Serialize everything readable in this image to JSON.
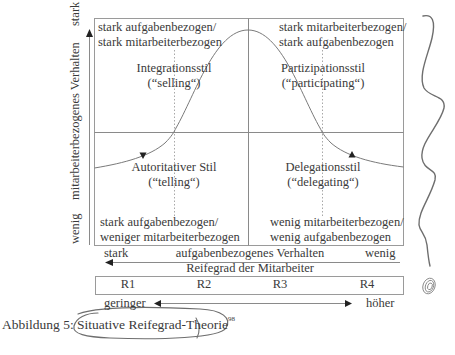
{
  "quadrants": {
    "top_left": {
      "line1": "stark aufgabenbezogen/",
      "line2": "stark mitarbeiterbezogen",
      "style": "Integrationsstil",
      "style_en": "(“selling“)"
    },
    "top_right": {
      "line1": "stark mitarbeiterbezogen/",
      "line2": "stark aufgabenbezogen",
      "style": "Partizipationsstil",
      "style_en": "(“participating“)"
    },
    "bottom_left": {
      "style": "Autoritativer Stil",
      "style_en": "(“telling“)",
      "line1": "stark aufgabenbezogen/",
      "line2": "weniger mitarbeiterbezogen"
    },
    "bottom_right": {
      "style": "Delegationsstil",
      "style_en": "(“delegating“)",
      "line1": "wenig mitarbeiterbezogen/",
      "line2": "wenig aufgabenbezogen"
    }
  },
  "y_axis": {
    "label": "mitarbeiterbezogenes Verhalten",
    "high": "stark",
    "low": "wenig"
  },
  "x_axis": {
    "label": "aufgabenbezogenes Verhalten",
    "left": "stark",
    "right": "wenig"
  },
  "maturity": {
    "label": "Reifegrad der Mitarbeiter",
    "levels": [
      "R1",
      "R2",
      "R3",
      "R4"
    ],
    "low": "geringer",
    "high": "höher"
  },
  "caption": {
    "prefix": "Abbildung 5: ",
    "title": "Situative Reifegrad-Theorie",
    "footnote": "98"
  },
  "colors": {
    "line": "#8a8a8a",
    "text": "#3a3a3a",
    "pen": "#6e6e6e"
  }
}
